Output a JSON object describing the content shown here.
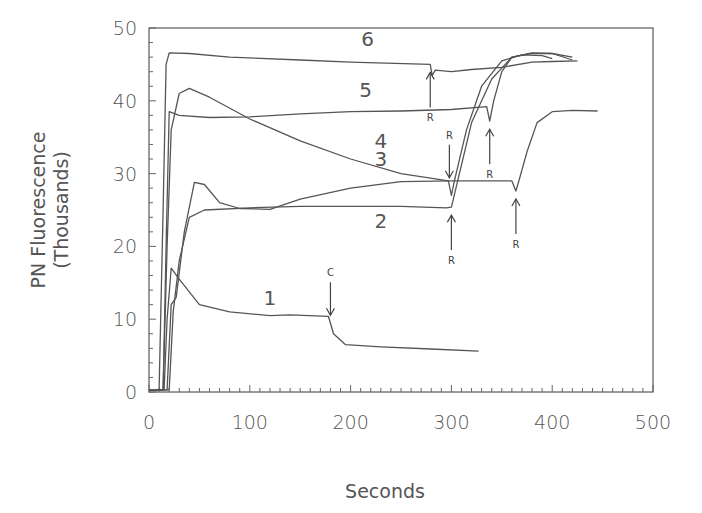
{
  "chart_data": {
    "type": "line",
    "title": "",
    "xlabel": "Seconds",
    "ylabel": "PN Fluorescence",
    "ylabel_sub": "(Thousands)",
    "xlim": [
      0,
      500
    ],
    "ylim": [
      0,
      50
    ],
    "x_ticks": [
      "0",
      "100",
      "200",
      "300",
      "400",
      "500"
    ],
    "y_ticks": [
      "0",
      "10",
      "20",
      "30",
      "40",
      "50"
    ],
    "grid": false,
    "legend": "none (curves labeled inline 1-6)",
    "series": [
      {
        "name": "1",
        "points": [
          [
            0,
            0.3
          ],
          [
            15,
            0.3
          ],
          [
            18,
            10
          ],
          [
            22,
            17
          ],
          [
            30,
            15.5
          ],
          [
            50,
            12
          ],
          [
            80,
            11
          ],
          [
            120,
            10.5
          ],
          [
            140,
            10.6
          ],
          [
            178,
            10.4
          ],
          [
            183,
            8
          ],
          [
            195,
            6.5
          ],
          [
            230,
            6.2
          ],
          [
            280,
            5.9
          ],
          [
            327,
            5.6
          ]
        ]
      },
      {
        "name": "2",
        "points": [
          [
            0,
            0.3
          ],
          [
            20,
            0.3
          ],
          [
            24,
            11
          ],
          [
            30,
            18
          ],
          [
            40,
            24
          ],
          [
            55,
            25
          ],
          [
            100,
            25.3
          ],
          [
            150,
            25.5
          ],
          [
            200,
            25.5
          ],
          [
            250,
            25.5
          ],
          [
            295,
            25.3
          ],
          [
            300,
            25.4
          ],
          [
            320,
            37
          ],
          [
            340,
            43
          ],
          [
            360,
            46
          ],
          [
            380,
            46.6
          ],
          [
            400,
            46.5
          ],
          [
            420,
            46
          ]
        ]
      },
      {
        "name": "3",
        "points": [
          [
            0,
            0.3
          ],
          [
            18,
            0.3
          ],
          [
            22,
            12
          ],
          [
            27,
            13
          ],
          [
            35,
            22
          ],
          [
            45,
            28.8
          ],
          [
            55,
            28.5
          ],
          [
            70,
            26
          ],
          [
            90,
            25.2
          ],
          [
            120,
            25.1
          ],
          [
            150,
            26.5
          ],
          [
            200,
            28
          ],
          [
            250,
            28.9
          ],
          [
            300,
            29
          ],
          [
            330,
            29
          ],
          [
            360,
            29
          ],
          [
            364,
            27.6
          ],
          [
            368,
            29.5
          ],
          [
            375,
            33
          ],
          [
            385,
            37
          ],
          [
            400,
            38.5
          ],
          [
            420,
            38.7
          ],
          [
            445,
            38.6
          ]
        ]
      },
      {
        "name": "4",
        "points": [
          [
            0,
            0.3
          ],
          [
            14,
            0.3
          ],
          [
            18,
            20
          ],
          [
            22,
            36
          ],
          [
            30,
            41
          ],
          [
            40,
            41.7
          ],
          [
            60,
            40.5
          ],
          [
            100,
            37.5
          ],
          [
            150,
            34.5
          ],
          [
            200,
            32
          ],
          [
            250,
            30
          ],
          [
            297,
            29
          ],
          [
            300,
            27
          ],
          [
            303,
            29
          ],
          [
            315,
            36
          ],
          [
            330,
            42
          ],
          [
            350,
            45.5
          ],
          [
            370,
            46.3
          ],
          [
            390,
            46.2
          ],
          [
            400,
            45.8
          ]
        ]
      },
      {
        "name": "5",
        "points": [
          [
            0,
            0.3
          ],
          [
            14,
            0.3
          ],
          [
            17,
            20
          ],
          [
            20,
            38.5
          ],
          [
            30,
            38
          ],
          [
            60,
            37.7
          ],
          [
            100,
            37.8
          ],
          [
            150,
            38.2
          ],
          [
            200,
            38.5
          ],
          [
            250,
            38.6
          ],
          [
            300,
            38.8
          ],
          [
            335,
            39.2
          ],
          [
            338,
            37.2
          ],
          [
            342,
            40
          ],
          [
            350,
            44
          ],
          [
            360,
            46
          ],
          [
            380,
            46.5
          ],
          [
            400,
            46.5
          ],
          [
            420,
            45.6
          ]
        ]
      },
      {
        "name": "6",
        "points": [
          [
            0,
            0.3
          ],
          [
            10,
            0.3
          ],
          [
            14,
            25
          ],
          [
            17,
            45
          ],
          [
            20,
            46.6
          ],
          [
            40,
            46.5
          ],
          [
            80,
            46
          ],
          [
            150,
            45.6
          ],
          [
            200,
            45.3
          ],
          [
            279,
            45
          ],
          [
            281,
            43.5
          ],
          [
            284,
            44.2
          ],
          [
            300,
            44
          ],
          [
            320,
            44.3
          ],
          [
            350,
            44.6
          ],
          [
            380,
            45.3
          ],
          [
            400,
            45.4
          ],
          [
            425,
            45.5
          ]
        ]
      }
    ],
    "annotations": [
      {
        "label": "C",
        "x": 180,
        "direction": "down",
        "curve": "1"
      },
      {
        "label": "R",
        "x": 279,
        "direction": "up",
        "curve": "6"
      },
      {
        "label": "R",
        "x": 298,
        "direction": "down",
        "curve": "4"
      },
      {
        "label": "R",
        "x": 300,
        "direction": "up",
        "curve": "2"
      },
      {
        "label": "R",
        "x": 338,
        "direction": "up",
        "curve": "5"
      },
      {
        "label": "R",
        "x": 364,
        "direction": "up",
        "curve": "3"
      }
    ],
    "curve_labels": [
      {
        "text": "1",
        "x": 120,
        "y": 12
      },
      {
        "text": "2",
        "x": 230,
        "y": 22.5
      },
      {
        "text": "3",
        "x": 230,
        "y": 31
      },
      {
        "text": "4",
        "x": 230,
        "y": 33.5
      },
      {
        "text": "5",
        "x": 215,
        "y": 40.5
      },
      {
        "text": "6",
        "x": 217,
        "y": 47.5
      }
    ]
  }
}
